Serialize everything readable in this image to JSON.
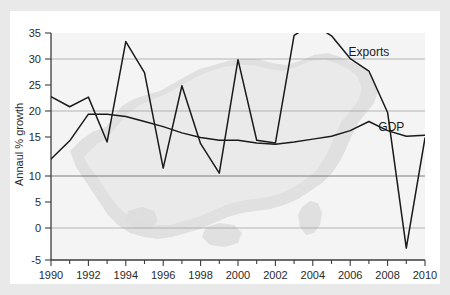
{
  "chart_data": {
    "type": "line",
    "title": "",
    "subtitle": "",
    "xlabel": "",
    "ylabel": "Annaul % growth",
    "xlim": [
      1990,
      2010
    ],
    "ylim": [
      -5,
      35
    ],
    "grid": true,
    "gridlines_y": [
      0,
      10,
      20,
      30
    ],
    "legend_position": "inline-annotation",
    "x_tick_labels": [
      "1990",
      "1992",
      "1994",
      "1996",
      "1998",
      "2000",
      "2002",
      "2004",
      "2006",
      "2008",
      "2010"
    ],
    "x_tick_values": [
      1990,
      1992,
      1994,
      1996,
      1998,
      2000,
      2002,
      2004,
      2006,
      2008,
      2010
    ],
    "x_minor_tick_values": [
      1991,
      1993,
      1995,
      1997,
      1999,
      2001,
      2003,
      2005,
      2007,
      2009
    ],
    "y_tick_labels": [
      "35",
      "30",
      "25",
      "20",
      "15",
      "10",
      "5",
      "0",
      "-5"
    ],
    "y_tick_values": [
      35,
      30,
      25,
      20,
      15,
      10,
      5,
      0,
      -5
    ],
    "x": [
      1990,
      1991,
      1992,
      1993,
      1994,
      1995,
      1996,
      1997,
      1998,
      1999,
      2000,
      2001,
      2002,
      2003,
      2004,
      2005,
      2006,
      2007,
      2008,
      2009,
      2010
    ],
    "series": [
      {
        "name": "Exports",
        "label": "Exports",
        "color": "#1a1a1a",
        "label_x": 2007.0,
        "label_y": 31.0,
        "values": [
          23.8,
          22.0,
          23.7,
          15.8,
          33.5,
          28.0,
          11.2,
          25.7,
          15.5,
          10.3,
          30.3,
          16.1,
          15.6,
          34.6,
          36.6,
          34.5,
          30.5,
          28.3,
          21.0,
          -2.9,
          16.5
        ]
      },
      {
        "name": "GDP",
        "label": "GDP",
        "color": "#1a1a1a",
        "label_x": 2008.2,
        "label_y": 17.7,
        "values": [
          12.8,
          16.0,
          20.7,
          20.7,
          20.3,
          19.4,
          18.5,
          17.4,
          16.6,
          16.1,
          16.1,
          15.6,
          15.4,
          15.8,
          16.3,
          16.8,
          17.8,
          19.4,
          17.8,
          16.8,
          17.0
        ]
      }
    ]
  }
}
